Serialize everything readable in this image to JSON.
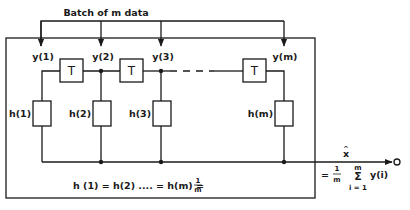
{
  "diagram": {
    "title": "Batch of m data",
    "inputs": [
      {
        "label": "y(1)"
      },
      {
        "label": "y(2)"
      },
      {
        "label": "y(3)"
      },
      {
        "label": "y(m)"
      }
    ],
    "delay_blocks": [
      {
        "label": "T"
      },
      {
        "label": "T"
      },
      {
        "label": "T"
      }
    ],
    "weight_blocks": [
      {
        "label": "h(1)"
      },
      {
        "label": "h(2)"
      },
      {
        "label": "h(3)"
      },
      {
        "label": "h(m)"
      }
    ],
    "weight_equation": {
      "lhs": "h (1) = h(2) .... = h(m) =",
      "frac_num": "1",
      "frac_den": "m"
    },
    "output": {
      "symbol": "x",
      "hat": "^",
      "eq": "=",
      "frac_num": "1",
      "frac_den": "m",
      "sum_symbol": "Σ",
      "sum_upper": "m",
      "sum_lower": "i = 1",
      "summand": "y(i)"
    }
  }
}
